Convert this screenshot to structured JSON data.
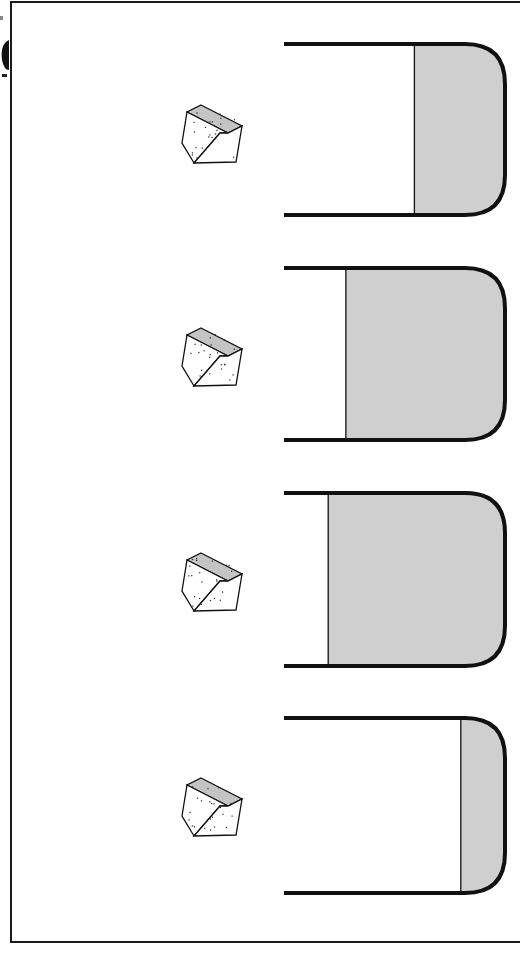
{
  "figure": {
    "colors": {
      "stroke": "#111111",
      "liquid": "#cfcfcf",
      "cube_top": "#c4c4c4",
      "cube_side": "#ffffff",
      "background": "#ffffff"
    },
    "panels": [
      {
        "id": 1,
        "object": "sugar-cube",
        "beaker_fill_fraction": 0.41
      },
      {
        "id": 2,
        "object": "sugar-cube",
        "beaker_fill_fraction": 0.72
      },
      {
        "id": 3,
        "object": "sugar-cube",
        "beaker_fill_fraction": 0.8
      },
      {
        "id": 4,
        "object": "sugar-cube",
        "beaker_fill_fraction": 0.2
      }
    ]
  }
}
